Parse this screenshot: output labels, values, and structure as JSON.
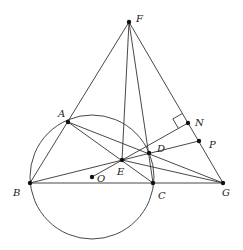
{
  "diagram": {
    "type": "geometry",
    "circle": {
      "name": "O",
      "cx": 92,
      "cy": 177,
      "r": 62
    },
    "points": {
      "F": {
        "x": 129,
        "y": 22,
        "label": "F",
        "lx": 136,
        "ly": 22
      },
      "A": {
        "x": 68,
        "y": 122,
        "label": "A",
        "lx": 58,
        "ly": 117
      },
      "B": {
        "x": 30,
        "y": 183,
        "label": "B",
        "lx": 13,
        "ly": 196
      },
      "C": {
        "x": 153,
        "y": 183,
        "label": "C",
        "lx": 158,
        "ly": 199
      },
      "D": {
        "x": 149,
        "y": 153,
        "label": "D",
        "lx": 157,
        "ly": 152
      },
      "E": {
        "x": 122,
        "y": 160,
        "label": "E",
        "lx": 117,
        "ly": 175
      },
      "O": {
        "x": 92,
        "y": 177,
        "label": "O",
        "lx": 97,
        "ly": 182
      },
      "N": {
        "x": 188,
        "y": 123,
        "label": "N",
        "lx": 195,
        "ly": 126
      },
      "P": {
        "x": 199,
        "y": 141,
        "label": "P",
        "lx": 209,
        "ly": 148
      },
      "G": {
        "x": 223,
        "y": 183,
        "label": "G",
        "lx": 222,
        "ly": 196
      }
    },
    "segments": [
      [
        "F",
        "B"
      ],
      [
        "F",
        "E"
      ],
      [
        "F",
        "C"
      ],
      [
        "F",
        "G"
      ],
      [
        "B",
        "G"
      ],
      [
        "B",
        "P"
      ],
      [
        "A",
        "C"
      ],
      [
        "A",
        "G"
      ],
      [
        "E",
        "G"
      ],
      [
        "O",
        "N"
      ]
    ],
    "right_angle": {
      "at": "N",
      "between": [
        "F",
        "E"
      ]
    }
  }
}
